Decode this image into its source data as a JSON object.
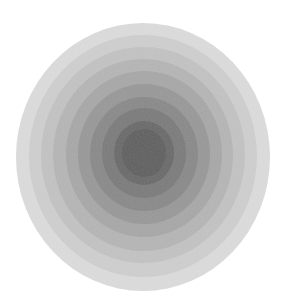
{
  "image": {
    "description": "Concentric filled circles in graduated grey tones, lightest at the outer edge and darkest at the center",
    "background": "#ffffff",
    "rings": [
      {
        "cx": 143,
        "cy": 157,
        "rx": 127,
        "ry": 134,
        "fill": "#dcdcdc"
      },
      {
        "cx": 143,
        "cy": 156,
        "rx": 114,
        "ry": 121,
        "fill": "#cfcfcf"
      },
      {
        "cx": 143,
        "cy": 155,
        "rx": 102,
        "ry": 108,
        "fill": "#c3c3c3"
      },
      {
        "cx": 143,
        "cy": 155,
        "rx": 90,
        "ry": 96,
        "fill": "#b6b6b6"
      },
      {
        "cx": 144,
        "cy": 154,
        "rx": 78,
        "ry": 83,
        "fill": "#a8a8a8"
      },
      {
        "cx": 144,
        "cy": 154,
        "rx": 66,
        "ry": 70,
        "fill": "#999999"
      },
      {
        "cx": 144,
        "cy": 154,
        "rx": 54,
        "ry": 57,
        "fill": "#8a8a8a"
      },
      {
        "cx": 144,
        "cy": 153,
        "rx": 42,
        "ry": 45,
        "fill": "#7b7b7b"
      },
      {
        "cx": 144,
        "cy": 153,
        "rx": 30,
        "ry": 32,
        "fill": "#6b6b6b"
      },
      {
        "cx": 144,
        "cy": 153,
        "rx": 22,
        "ry": 24,
        "fill": "#606060"
      }
    ]
  }
}
